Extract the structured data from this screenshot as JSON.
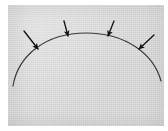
{
  "figure": {
    "canvas": {
      "width": 168,
      "height": 131,
      "background": "#ffffff"
    },
    "panel": {
      "label": "diagram-panel",
      "x": 8,
      "y": 5,
      "width": 156,
      "height": 121,
      "fill": "#d7d7d7",
      "texture": "paper-grain"
    },
    "arc": {
      "label": "arc-curve",
      "description": "dome-shaped arc, convex upward",
      "stroke": "#3a3a3a",
      "stroke_width": 1.2,
      "path": "M 13 86 C 18 56, 45 33, 86 33 C 127 33, 154 55, 161 81",
      "apex": {
        "x": 86,
        "y": 33
      },
      "left_end": {
        "x": 13,
        "y": 86
      },
      "right_end": {
        "x": 161,
        "y": 81
      }
    },
    "arrows": [
      {
        "label": "arrow-1",
        "tail": {
          "x": 24,
          "y": 31
        },
        "tip": {
          "x": 38,
          "y": 49
        },
        "direction": "down-right",
        "color": "#111111"
      },
      {
        "label": "arrow-2",
        "tail": {
          "x": 64,
          "y": 21
        },
        "tip": {
          "x": 68,
          "y": 36
        },
        "direction": "down",
        "color": "#111111"
      },
      {
        "label": "arrow-3",
        "tail": {
          "x": 114,
          "y": 21
        },
        "tip": {
          "x": 108,
          "y": 36
        },
        "direction": "down-left",
        "color": "#111111"
      },
      {
        "label": "arrow-4",
        "tail": {
          "x": 154,
          "y": 35
        },
        "tip": {
          "x": 139,
          "y": 49
        },
        "direction": "down-left",
        "color": "#111111"
      }
    ]
  }
}
